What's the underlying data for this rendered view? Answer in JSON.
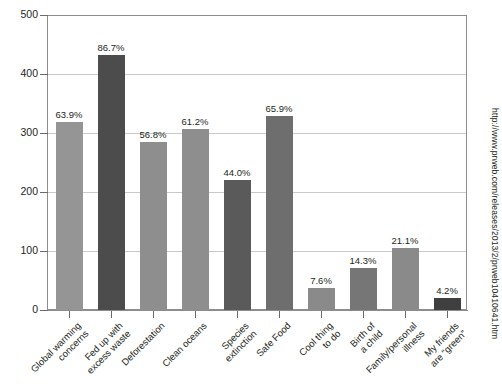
{
  "source_url": "http://www.prweb.com/releases/2013/2/prweb10410641.htm",
  "axis": {
    "y_ticks": [
      "500",
      "400",
      "300",
      "200",
      "100",
      "0"
    ]
  },
  "chart_data": {
    "type": "bar",
    "title": "",
    "xlabel": "",
    "ylabel": "",
    "ylim": [
      0,
      500
    ],
    "grid": true,
    "legend": "none",
    "categories": [
      "Global warming\nconcerns",
      "Fed up with\nexcess waste",
      "Deforestation",
      "Clean oceans",
      "Species\nextinction",
      "Safe Food",
      "Cool thing\nto do",
      "Birth of\na child",
      "Family/personal\nillness",
      "My friends\nare “green”"
    ],
    "values": [
      319,
      433,
      284,
      306,
      220,
      329,
      38,
      71,
      105,
      21
    ],
    "data_labels": [
      "63.9%",
      "86.7%",
      "56.8%",
      "61.2%",
      "44.0%",
      "65.9%",
      "7.6%",
      "14.3%",
      "21.1%",
      "4.2%"
    ],
    "bar_colors": [
      "#959595",
      "#4c4c4c",
      "#8e8e8e",
      "#8e8e8e",
      "#5a5a5a",
      "#6e6e6e",
      "#8a8a8a",
      "#767676",
      "#8a8a8a",
      "#3f3f3f",
      "#a9a9a9"
    ],
    "colors": {
      "axis": "#8d8d8d",
      "grid": "#c9c9c9",
      "text": "#231f20",
      "background": "#ffffff"
    }
  }
}
